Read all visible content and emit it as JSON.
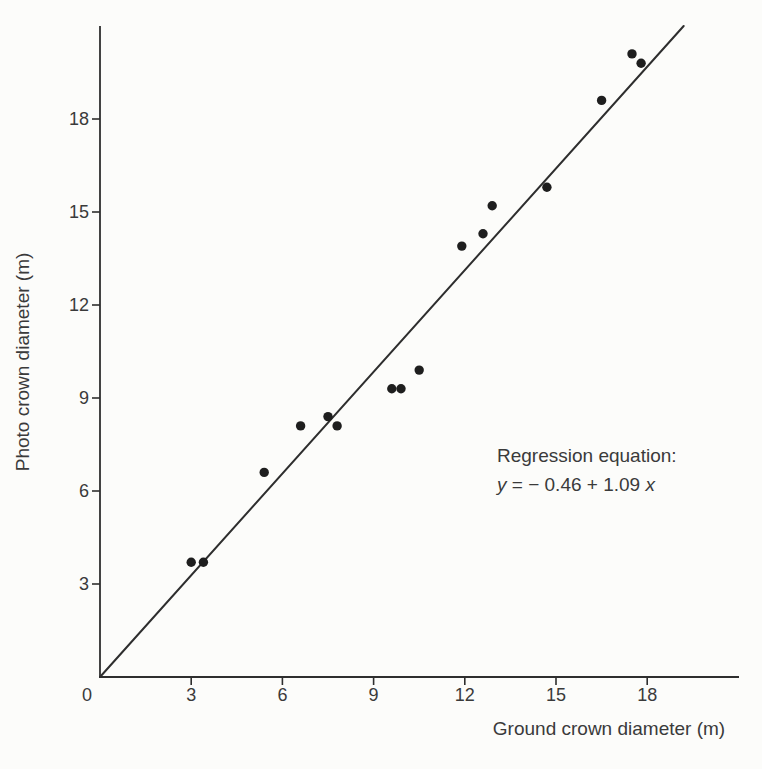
{
  "figure": {
    "background_color": "#fcfcfa",
    "ink_color": "#3a3a3a",
    "axis_color": "#2e2e2e",
    "point_color": "#1e1e1e"
  },
  "chart_data": {
    "type": "scatter",
    "title": "",
    "xlabel": "Ground crown diameter (m)",
    "ylabel": "Photo crown diameter (m)",
    "xlim": [
      0,
      21
    ],
    "ylim": [
      0,
      21
    ],
    "grid": false,
    "legend": "none",
    "x_ticks": [
      3,
      6,
      9,
      12,
      15,
      18
    ],
    "y_ticks": [
      3,
      6,
      9,
      12,
      15,
      18
    ],
    "origin_label": "0",
    "points": [
      [
        3.0,
        3.7
      ],
      [
        3.4,
        3.7
      ],
      [
        5.4,
        6.6
      ],
      [
        6.6,
        8.1
      ],
      [
        7.5,
        8.4
      ],
      [
        7.8,
        8.1
      ],
      [
        9.6,
        9.3
      ],
      [
        9.9,
        9.3
      ],
      [
        10.5,
        9.9
      ],
      [
        11.9,
        13.9
      ],
      [
        12.6,
        14.3
      ],
      [
        12.9,
        15.2
      ],
      [
        14.7,
        15.8
      ],
      [
        16.5,
        18.6
      ],
      [
        17.5,
        20.1
      ],
      [
        17.8,
        19.8
      ]
    ],
    "regression": {
      "slope": 1.09,
      "intercept": -0.46,
      "line_start": [
        0,
        0
      ],
      "line_end": [
        19.2,
        21.0
      ]
    },
    "annotation": {
      "title": "Regression equation:",
      "eq_y": "y",
      "eq_mid": " = − 0.46 + 1.09",
      "eq_x": "x"
    }
  }
}
